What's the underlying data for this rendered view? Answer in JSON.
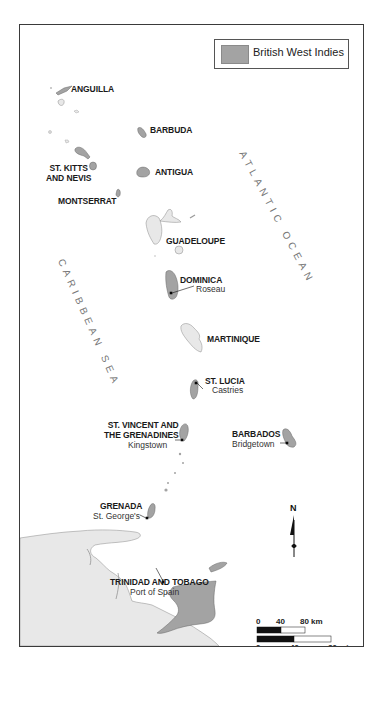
{
  "legend": {
    "label": "British West Indies",
    "swatch_color": "#a3a3a3"
  },
  "colors": {
    "british": "#a3a3a3",
    "other_land": "#e8e8e8",
    "water": "#ffffff",
    "border": "#3a3a3a"
  },
  "seas": {
    "atlantic": "ATLANTIC OCEAN",
    "caribbean": "CARIBBEAN SEA"
  },
  "islands": {
    "anguilla": {
      "name": "ANGUILLA"
    },
    "barbuda": {
      "name": "BARBUDA"
    },
    "st_kitts": {
      "name_line1": "ST. KITTS",
      "name_line2": "AND NEVIS"
    },
    "antigua": {
      "name": "ANTIGUA"
    },
    "montserrat": {
      "name": "MONTSERRAT"
    },
    "guadeloupe": {
      "name": "GUADELOUPE"
    },
    "dominica": {
      "name": "DOMINICA",
      "capital": "Roseau"
    },
    "martinique": {
      "name": "MARTINIQUE"
    },
    "st_lucia": {
      "name": "ST. LUCIA",
      "capital": "Castries"
    },
    "st_vincent": {
      "name_line1": "ST. VINCENT AND",
      "name_line2": "THE GRENADINES",
      "capital": "Kingstown"
    },
    "barbados": {
      "name": "BARBADOS",
      "capital": "Bridgetown"
    },
    "grenada": {
      "name": "GRENADA",
      "capital": "St. George's"
    },
    "trinidad": {
      "name": "TRINIDAD AND TOBAGO",
      "capital": "Port of Spain"
    }
  },
  "compass": {
    "label": "N"
  },
  "scale": {
    "km_ticks": [
      "0",
      "40",
      "80 km"
    ],
    "mi_ticks": [
      "0",
      "40",
      "80 mi"
    ]
  }
}
